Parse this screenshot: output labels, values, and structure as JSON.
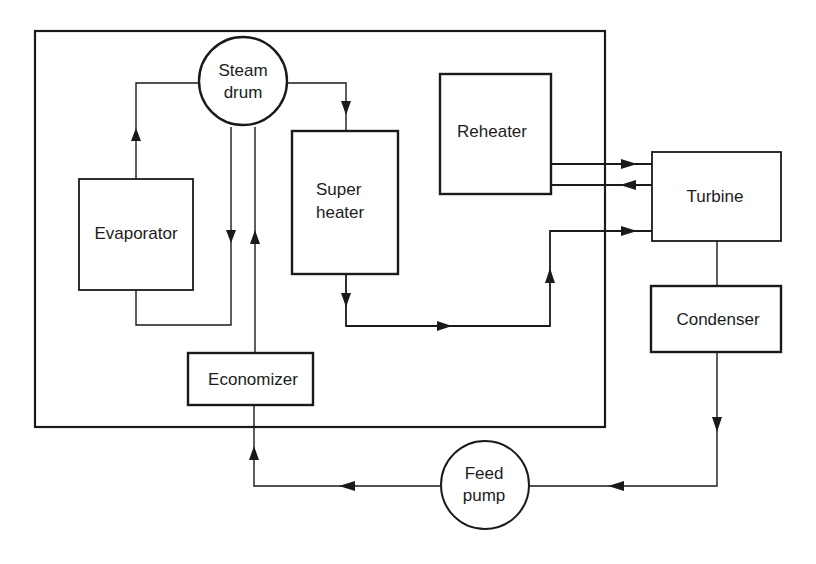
{
  "diagram": {
    "colors": {
      "stroke": "#1a1a1a",
      "background": "#ffffff",
      "text": "#1c1c1c"
    },
    "components": {
      "steam_drum": {
        "line1": "Steam",
        "line2": "drum",
        "shape": "circle"
      },
      "evaporator": {
        "label": "Evaporator",
        "shape": "rectangle"
      },
      "superheater": {
        "line1": "Super",
        "line2": "heater",
        "shape": "rectangle"
      },
      "reheater": {
        "label": "Reheater",
        "shape": "rectangle"
      },
      "turbine": {
        "label": "Turbine",
        "shape": "rectangle"
      },
      "condenser": {
        "label": "Condenser",
        "shape": "rectangle"
      },
      "economizer": {
        "label": "Economizer",
        "shape": "rectangle"
      },
      "feed_pump": {
        "line1": "Feed",
        "line2": "pump",
        "shape": "circle"
      }
    },
    "boundary": {
      "label": "Boiler enclosure",
      "contains": [
        "steam_drum",
        "evaporator",
        "superheater",
        "reheater",
        "economizer"
      ]
    },
    "flows": [
      {
        "from": "evaporator",
        "to": "steam_drum"
      },
      {
        "from": "steam_drum",
        "to": "evaporator"
      },
      {
        "from": "steam_drum",
        "to": "superheater"
      },
      {
        "from": "superheater",
        "to": "turbine"
      },
      {
        "from": "reheater",
        "to": "turbine"
      },
      {
        "from": "turbine",
        "to": "reheater"
      },
      {
        "from": "turbine",
        "to": "condenser"
      },
      {
        "from": "condenser",
        "to": "feed_pump"
      },
      {
        "from": "feed_pump",
        "to": "economizer"
      },
      {
        "from": "economizer",
        "to": "steam_drum"
      }
    ]
  }
}
